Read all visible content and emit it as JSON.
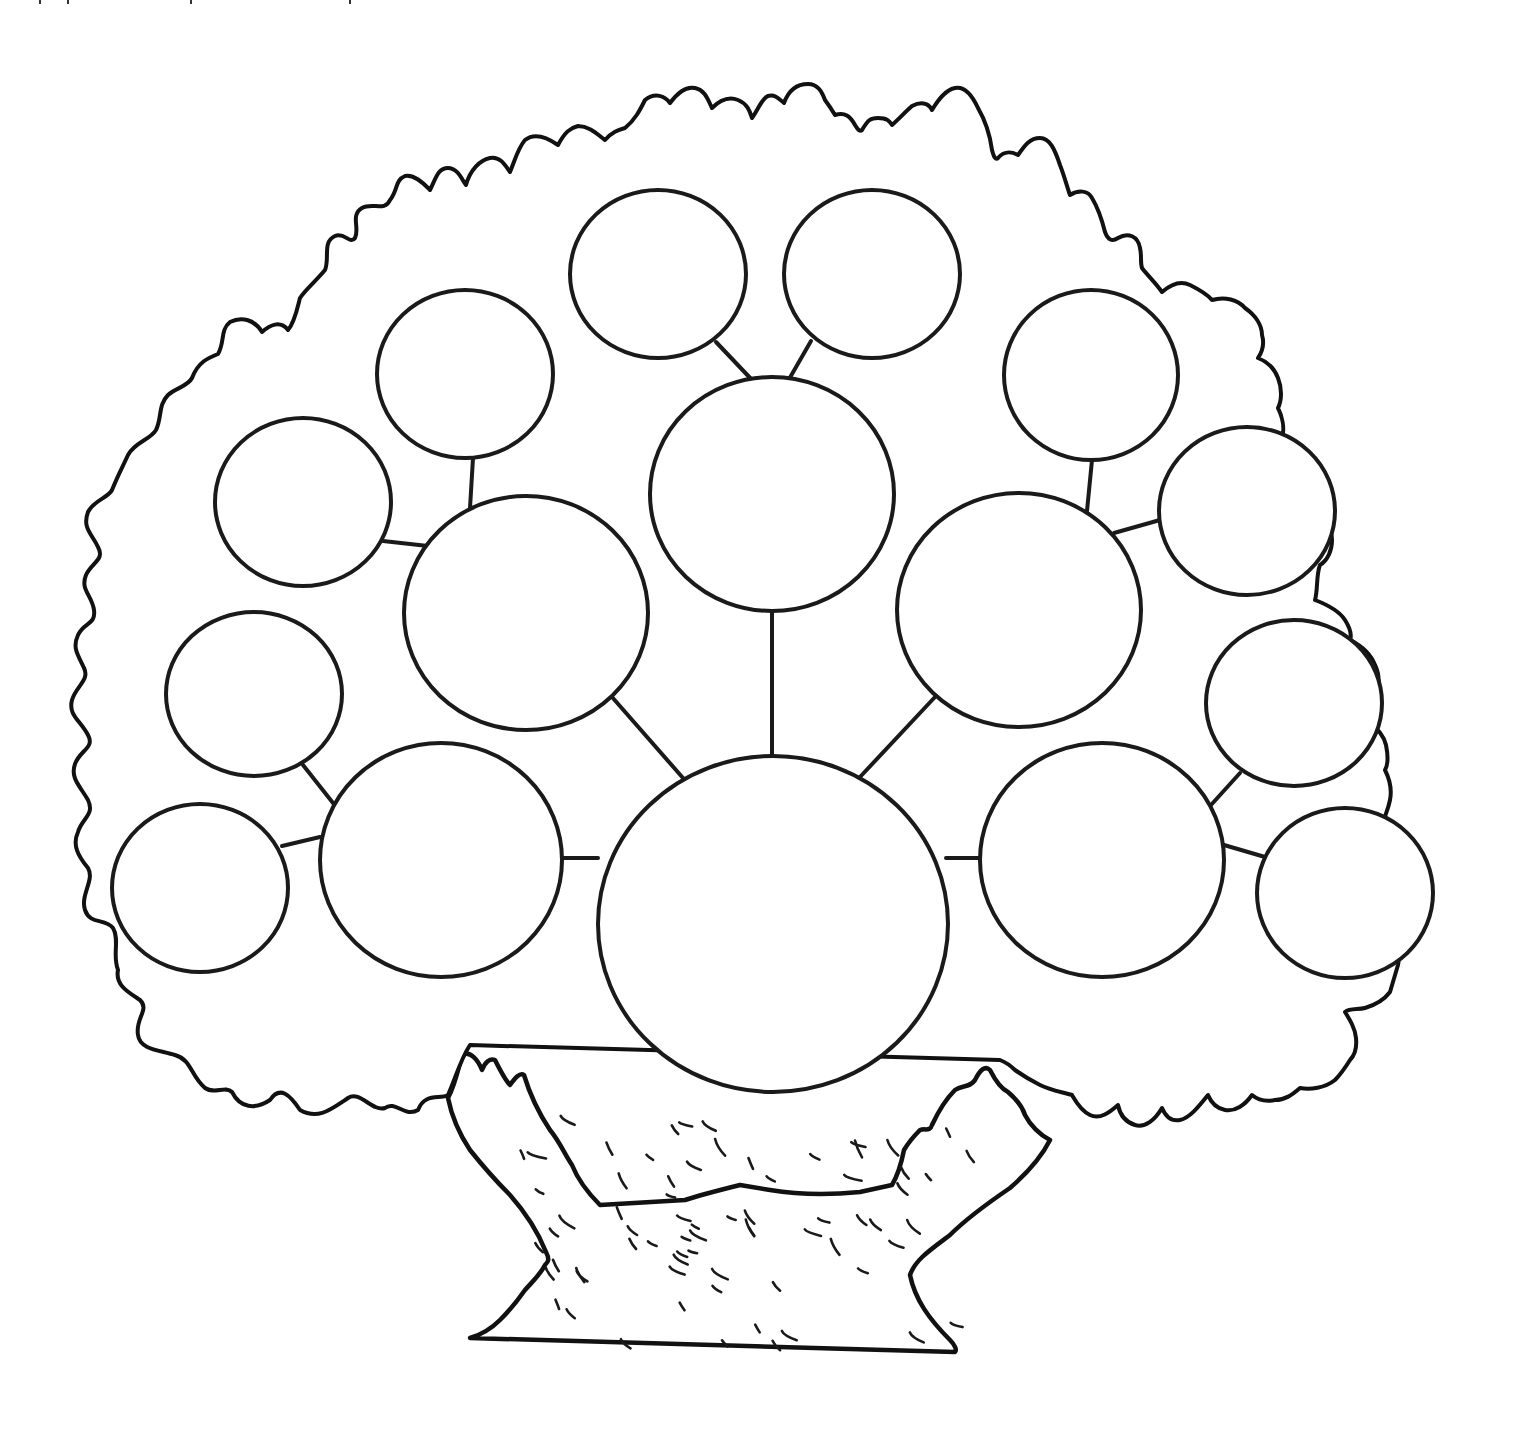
{
  "diagram": {
    "type": "family-tree-template",
    "colors": {
      "stroke": "#1a1a1a",
      "background": "#ffffff"
    },
    "nodes": [
      {
        "id": "root",
        "label": "",
        "cx": 773,
        "cy": 924,
        "rx": 175,
        "ry": 168
      },
      {
        "id": "parent-left",
        "label": "",
        "cx": 441,
        "cy": 860,
        "rx": 121,
        "ry": 117
      },
      {
        "id": "parent-right",
        "label": "",
        "cx": 1102,
        "cy": 860,
        "rx": 122,
        "ry": 117
      },
      {
        "id": "parent-mid-left",
        "label": "",
        "cx": 526,
        "cy": 613,
        "rx": 122,
        "ry": 117
      },
      {
        "id": "parent-top",
        "label": "",
        "cx": 772,
        "cy": 494,
        "rx": 122,
        "ry": 117
      },
      {
        "id": "parent-mid-right",
        "label": "",
        "cx": 1019,
        "cy": 610,
        "rx": 122,
        "ry": 117
      },
      {
        "id": "gp-bottom-left",
        "label": "",
        "cx": 200,
        "cy": 888,
        "rx": 88,
        "ry": 84
      },
      {
        "id": "gp-lower-left",
        "label": "",
        "cx": 254,
        "cy": 694,
        "rx": 88,
        "ry": 82
      },
      {
        "id": "gp-upper-left",
        "label": "",
        "cx": 303,
        "cy": 502,
        "rx": 88,
        "ry": 84
      },
      {
        "id": "gp-top-left",
        "label": "",
        "cx": 465,
        "cy": 374,
        "rx": 88,
        "ry": 84
      },
      {
        "id": "gp-top-center-left",
        "label": "",
        "cx": 658,
        "cy": 274,
        "rx": 88,
        "ry": 84
      },
      {
        "id": "gp-top-center-right",
        "label": "",
        "cx": 872,
        "cy": 274,
        "rx": 88,
        "ry": 84
      },
      {
        "id": "gp-top-right",
        "label": "",
        "cx": 1091,
        "cy": 375,
        "rx": 87,
        "ry": 85
      },
      {
        "id": "gp-upper-right",
        "label": "",
        "cx": 1247,
        "cy": 511,
        "rx": 88,
        "ry": 84
      },
      {
        "id": "gp-lower-right",
        "label": "",
        "cx": 1294,
        "cy": 703,
        "rx": 88,
        "ry": 83
      },
      {
        "id": "gp-bottom-right",
        "label": "",
        "cx": 1345,
        "cy": 893,
        "rx": 88,
        "ry": 85
      }
    ],
    "edges": [
      {
        "from": "root",
        "to": "parent-left",
        "x1": 598,
        "y1": 858,
        "x2": 562,
        "y2": 858
      },
      {
        "from": "root",
        "to": "parent-right",
        "x1": 946,
        "y1": 858,
        "x2": 981,
        "y2": 858
      },
      {
        "from": "root",
        "to": "parent-mid-left",
        "x1": 683,
        "y1": 778,
        "x2": 612,
        "y2": 697
      },
      {
        "from": "root",
        "to": "parent-top",
        "x1": 772,
        "y1": 757,
        "x2": 772,
        "y2": 611
      },
      {
        "from": "root",
        "to": "parent-mid-right",
        "x1": 860,
        "y1": 777,
        "x2": 935,
        "y2": 697
      },
      {
        "from": "parent-left",
        "to": "gp-bottom-left",
        "x1": 320,
        "y1": 837,
        "x2": 282,
        "y2": 846
      },
      {
        "from": "parent-left",
        "to": "gp-lower-left",
        "x1": 333,
        "y1": 803,
        "x2": 303,
        "y2": 765
      },
      {
        "from": "parent-mid-left",
        "to": "gp-upper-left",
        "x1": 428,
        "y1": 546,
        "x2": 383,
        "y2": 541
      },
      {
        "from": "parent-mid-left",
        "to": "gp-top-left",
        "x1": 470,
        "y1": 508,
        "x2": 473,
        "y2": 458
      },
      {
        "from": "parent-top",
        "to": "gp-top-center-left",
        "x1": 753,
        "y1": 381,
        "x2": 716,
        "y2": 342
      },
      {
        "from": "parent-top",
        "to": "gp-top-center-right",
        "x1": 788,
        "y1": 381,
        "x2": 811,
        "y2": 341
      },
      {
        "from": "parent-mid-right",
        "to": "gp-top-right",
        "x1": 1087,
        "y1": 511,
        "x2": 1092,
        "y2": 460
      },
      {
        "from": "parent-mid-right",
        "to": "gp-upper-right",
        "x1": 1114,
        "y1": 533,
        "x2": 1160,
        "y2": 520
      },
      {
        "from": "parent-right",
        "to": "gp-lower-right",
        "x1": 1211,
        "y1": 805,
        "x2": 1240,
        "y2": 773
      },
      {
        "from": "parent-right",
        "to": "gp-bottom-right",
        "x1": 1224,
        "y1": 845,
        "x2": 1265,
        "y2": 857
      }
    ],
    "canopy_path": "M 470 1045 C 460 1060 455 1080 448 1095 C 440 1100 425 1092 418 1110 C 405 1118 395 1100 385 1108 C 372 1112 360 1090 348 1098 C 330 1110 318 1120 300 1110 C 290 1095 280 1085 270 1100 C 255 1110 240 1108 232 1092 C 225 1085 215 1095 205 1088 C 190 1075 192 1060 175 1055 C 160 1050 140 1050 138 1035 C 135 1018 150 1010 140 1000 C 128 992 115 985 118 970 C 112 955 120 940 113 928 C 105 918 90 925 85 910 C 80 895 95 880 88 868 C 78 856 72 845 78 832 C 82 818 95 815 88 800 C 80 786 70 778 75 764 C 80 750 95 748 88 735 C 80 720 68 715 72 700 C 76 686 90 680 84 668 C 78 655 72 648 78 635 C 84 622 96 625 94 610 C 92 595 80 590 86 575 C 92 562 105 560 98 547 C 92 534 82 528 88 512 C 94 500 108 498 112 490 C 118 475 122 468 128 455 C 135 442 150 440 156 430 C 162 418 158 405 168 395 C 176 388 188 386 192 378 C 198 362 208 358 218 354 C 225 342 220 330 230 322 C 242 316 255 320 262 332 C 270 325 280 320 288 330 C 295 322 298 305 300 298 C 305 290 315 282 325 270 C 330 258 322 242 335 236 C 345 232 350 245 355 238 C 360 228 350 215 362 208 C 372 202 385 212 390 200 C 398 190 395 180 405 176 C 415 174 425 185 430 190 C 436 178 438 168 448 168 C 458 168 462 180 466 185 C 470 170 480 160 490 158 C 500 156 505 165 510 172 C 515 160 518 148 525 140 C 535 132 548 138 558 145 C 565 132 570 128 578 126 C 590 126 598 135 605 140 C 612 132 618 130 625 128 C 635 120 640 110 645 100 C 655 92 665 96 670 103 C 678 92 686 86 695 88 C 705 90 708 100 712 108 C 720 100 728 96 738 100 C 748 104 750 112 752 118 C 758 110 762 98 768 96 C 776 94 780 100 784 103 C 788 92 796 84 808 84 C 818 84 822 92 825 100 C 828 104 832 110 835 115 C 845 112 850 116 855 125 C 858 130 860 132 862 130 C 868 120 870 118 878 118 C 888 118 890 122 892 125 C 900 118 905 112 912 106 C 920 102 928 102 932 110 C 938 100 945 90 955 88 C 965 86 972 95 978 108 C 985 120 990 135 992 150 C 994 158 996 160 998 158 C 1005 150 1012 152 1018 155 C 1025 145 1030 138 1040 138 C 1050 138 1055 150 1060 165 C 1065 178 1068 190 1070 195 C 1078 190 1088 190 1092 198 C 1098 208 1102 220 1105 232 C 1108 240 1112 242 1118 238 C 1128 232 1138 236 1140 248 C 1142 256 1140 262 1142 268 C 1148 276 1155 282 1162 292 C 1170 285 1180 280 1190 285 C 1200 290 1208 295 1212 300 C 1225 296 1238 300 1245 308 C 1255 315 1262 325 1262 335 C 1265 345 1262 352 1258 358 C 1268 362 1275 370 1278 378 C 1282 388 1282 400 1278 408 C 1282 416 1285 428 1282 438 C 1285 448 1290 460 1300 465 C 1312 470 1320 480 1322 490 C 1324 500 1322 510 1318 515 C 1325 520 1332 530 1332 540 C 1332 550 1328 560 1320 565 C 1316 575 1318 590 1315 600 C 1328 605 1340 612 1345 620 C 1350 628 1352 635 1350 640 C 1360 645 1370 652 1375 665 C 1380 675 1380 690 1375 700 C 1372 708 1370 712 1368 720 C 1376 728 1384 735 1386 745 C 1388 755 1388 765 1385 770 C 1390 780 1392 790 1390 800 C 1388 810 1385 815 1384 820 C 1392 830 1398 840 1398 850 C 1398 862 1396 870 1396 878 C 1398 888 1398 900 1396 910 C 1392 922 1390 930 1392 938 C 1398 945 1400 955 1398 965 C 1395 975 1392 985 1390 992 C 1384 1000 1375 1005 1365 1008 C 1358 1010 1350 1008 1345 1012 C 1350 1020 1355 1028 1356 1038 C 1357 1048 1355 1055 1350 1060 C 1345 1068 1340 1075 1335 1080 C 1325 1088 1310 1090 1300 1088 C 1292 1095 1285 1100 1275 1100 C 1265 1102 1258 1100 1252 1095 C 1245 1105 1235 1112 1225 1110 C 1215 1108 1210 1100 1208 1095 C 1200 1105 1190 1118 1180 1120 C 1170 1122 1165 1115 1162 1108 C 1155 1120 1145 1128 1135 1125 C 1125 1122 1120 1115 1118 1105 C 1110 1112 1100 1120 1090 1115 C 1080 1110 1075 1100 1072 1095 C 1062 1092 1050 1090 1040 1085 C 1030 1080 1022 1075 1015 1070 C 1010 1065 1005 1062 1000 1060 Z",
    "trunk_path": "M 448 1098 C 455 1085 458 1070 462 1055 C 470 1050 478 1060 482 1070 C 485 1062 490 1058 495 1060 C 500 1070 505 1080 510 1085 C 515 1078 520 1072 524 1075 C 530 1095 540 1115 550 1130 C 560 1142 565 1155 572 1165 C 578 1180 590 1195 600 1205 L 685 1200 C 700 1195 720 1190 740 1185 L 770 1190 C 800 1195 830 1195 860 1192 L 892 1185 C 898 1175 902 1160 904 1150 C 910 1140 915 1135 920 1130 C 925 1128 930 1132 932 1125 C 938 1112 945 1100 955 1090 C 962 1085 970 1088 975 1080 C 980 1070 985 1065 990 1070 C 995 1080 1000 1088 1008 1092 C 1015 1098 1022 1105 1025 1115 C 1030 1125 1040 1135 1050 1140 C 1040 1160 1025 1175 1010 1188 C 985 1205 965 1220 950 1235 C 930 1250 915 1260 910 1275 C 915 1300 930 1320 950 1340 C 955 1345 957 1350 955 1352 L 470 1338 C 480 1335 490 1330 500 1320 C 510 1310 518 1300 525 1290 C 532 1282 540 1275 545 1265 C 548 1262 550 1260 546 1252 C 538 1232 525 1212 510 1195 C 495 1180 482 1165 470 1150 C 460 1135 452 1118 448 1098 Z",
    "bark_marks_count": 70,
    "text_labels": []
  }
}
